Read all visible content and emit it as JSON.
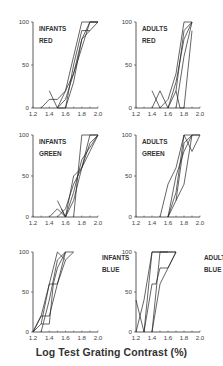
{
  "chart_data": {
    "type": "line",
    "title": "",
    "xlabel": "Log Test Grating Contrast (%)",
    "ylabel": "",
    "xlim": [
      1.2,
      2.0
    ],
    "ylim": [
      0,
      100
    ],
    "x_ticks": [
      "1.2",
      "1.4",
      "1.6",
      "1.8",
      "2.0"
    ],
    "y_ticks": [
      "0",
      "50",
      "100"
    ],
    "grid": false,
    "legend": "none",
    "panels": [
      {
        "id": "infants-red",
        "label_line1": "INFANTS",
        "label_line2": "RED",
        "label_pos": "upper-left",
        "series": [
          {
            "name": "s1",
            "x": [
              1.3,
              1.4,
              1.5,
              1.6,
              1.7,
              1.8,
              2.0
            ],
            "y": [
              0,
              10,
              10,
              20,
              60,
              100,
              100
            ]
          },
          {
            "name": "s2",
            "x": [
              1.4,
              1.5,
              1.6,
              1.7,
              1.8,
              1.9,
              2.0
            ],
            "y": [
              20,
              0,
              20,
              40,
              80,
              100,
              100
            ]
          },
          {
            "name": "s3",
            "x": [
              1.5,
              1.6,
              1.7,
              1.8,
              1.9,
              2.0
            ],
            "y": [
              0,
              0,
              30,
              80,
              90,
              100
            ]
          },
          {
            "name": "s4",
            "x": [
              1.5,
              1.6,
              1.7,
              1.8,
              1.9,
              2.0
            ],
            "y": [
              0,
              10,
              40,
              70,
              100,
              100
            ]
          },
          {
            "name": "s5",
            "x": [
              1.6,
              1.7,
              1.8,
              1.9
            ],
            "y": [
              0,
              50,
              90,
              90
            ]
          }
        ]
      },
      {
        "id": "adults-red",
        "label_line1": "ADULTS",
        "label_line2": "RED",
        "label_pos": "upper-left",
        "series": [
          {
            "name": "s1",
            "x": [
              1.4,
              1.5,
              1.6,
              1.7,
              1.8,
              1.9
            ],
            "y": [
              20,
              0,
              10,
              40,
              100,
              100
            ]
          },
          {
            "name": "s2",
            "x": [
              1.4,
              1.5,
              1.6,
              1.7,
              1.8,
              1.9
            ],
            "y": [
              0,
              20,
              0,
              20,
              90,
              100
            ]
          },
          {
            "name": "s3",
            "x": [
              1.6,
              1.7,
              1.8,
              1.9
            ],
            "y": [
              0,
              30,
              80,
              100
            ]
          },
          {
            "name": "s4",
            "x": [
              1.7,
              1.8,
              1.9
            ],
            "y": [
              0,
              60,
              100
            ]
          },
          {
            "name": "s5",
            "x": [
              1.7,
              1.75,
              1.8,
              1.9
            ],
            "y": [
              20,
              0,
              0,
              90
            ]
          }
        ]
      },
      {
        "id": "infants-green",
        "label_line1": "INFANTS",
        "label_line2": "GREEN",
        "label_pos": "upper-left",
        "series": [
          {
            "name": "s1",
            "x": [
              1.4,
              1.5,
              1.6,
              1.7,
              1.8,
              1.9,
              2.0
            ],
            "y": [
              0,
              10,
              0,
              50,
              60,
              80,
              100
            ]
          },
          {
            "name": "s2",
            "x": [
              1.5,
              1.6,
              1.7,
              1.8,
              1.9,
              2.0
            ],
            "y": [
              20,
              0,
              20,
              60,
              90,
              100
            ]
          },
          {
            "name": "s3",
            "x": [
              1.5,
              1.6,
              1.7,
              1.8,
              1.9,
              2.0
            ],
            "y": [
              0,
              10,
              40,
              60,
              100,
              100
            ]
          },
          {
            "name": "s4",
            "x": [
              1.55,
              1.6,
              1.7,
              1.8,
              2.0
            ],
            "y": [
              10,
              0,
              30,
              70,
              100
            ]
          },
          {
            "name": "s5",
            "x": [
              1.7,
              1.8,
              2.0
            ],
            "y": [
              0,
              100,
              100
            ]
          }
        ]
      },
      {
        "id": "adults-green",
        "label_line1": "ADULTS",
        "label_line2": "GREEN",
        "label_pos": "upper-left",
        "series": [
          {
            "name": "s1",
            "x": [
              1.5,
              1.6,
              1.7,
              1.8,
              1.9,
              2.0
            ],
            "y": [
              0,
              40,
              60,
              100,
              100,
              100
            ]
          },
          {
            "name": "s2",
            "x": [
              1.6,
              1.7,
              1.8,
              1.9,
              2.0
            ],
            "y": [
              0,
              30,
              100,
              80,
              100
            ]
          },
          {
            "name": "s3",
            "x": [
              1.6,
              1.7,
              1.8,
              1.9,
              2.0
            ],
            "y": [
              0,
              20,
              40,
              100,
              100
            ]
          },
          {
            "name": "s4",
            "x": [
              1.6,
              1.7,
              1.8,
              1.9
            ],
            "y": [
              0,
              50,
              80,
              100
            ]
          },
          {
            "name": "s5",
            "x": [
              1.7,
              1.8,
              1.9
            ],
            "y": [
              20,
              90,
              100
            ]
          }
        ]
      },
      {
        "id": "infants-blue",
        "label_line1": "INFANTS",
        "label_line2": "BLUE",
        "label_pos": "upper-right",
        "series": [
          {
            "name": "s1",
            "x": [
              1.2,
              1.3,
              1.4,
              1.5,
              1.6,
              1.7
            ],
            "y": [
              0,
              20,
              60,
              100,
              90,
              100
            ]
          },
          {
            "name": "s2",
            "x": [
              1.2,
              1.3,
              1.4,
              1.5,
              1.6
            ],
            "y": [
              0,
              20,
              20,
              60,
              100
            ]
          },
          {
            "name": "s3",
            "x": [
              1.3,
              1.4,
              1.45,
              1.5,
              1.6
            ],
            "y": [
              10,
              10,
              60,
              80,
              100
            ]
          },
          {
            "name": "s4",
            "x": [
              1.2,
              1.3,
              1.4,
              1.5,
              1.6
            ],
            "y": [
              0,
              10,
              60,
              60,
              90
            ]
          },
          {
            "name": "s5",
            "x": [
              1.3,
              1.4,
              1.5,
              1.6,
              1.7
            ],
            "y": [
              0,
              40,
              90,
              100,
              100
            ]
          }
        ]
      },
      {
        "id": "adults-blue",
        "label_line1": "ADULTS",
        "label_line2": "BLUE",
        "label_pos": "upper-right",
        "series": [
          {
            "name": "s1",
            "x": [
              1.2,
              1.3,
              1.4,
              1.5,
              1.6
            ],
            "y": [
              40,
              0,
              100,
              100,
              100
            ]
          },
          {
            "name": "s2",
            "x": [
              1.2,
              1.3,
              1.4,
              1.5,
              1.6,
              1.7
            ],
            "y": [
              0,
              40,
              100,
              100,
              100,
              100
            ]
          },
          {
            "name": "s3",
            "x": [
              1.3,
              1.4,
              1.45,
              1.5,
              1.6,
              1.7
            ],
            "y": [
              0,
              60,
              60,
              80,
              80,
              100
            ]
          },
          {
            "name": "s4",
            "x": [
              1.4,
              1.5,
              1.6,
              1.7
            ],
            "y": [
              0,
              100,
              100,
              100
            ]
          },
          {
            "name": "s5",
            "x": [
              1.4,
              1.5,
              1.6,
              1.7
            ],
            "y": [
              0,
              60,
              80,
              100
            ]
          }
        ]
      }
    ]
  }
}
